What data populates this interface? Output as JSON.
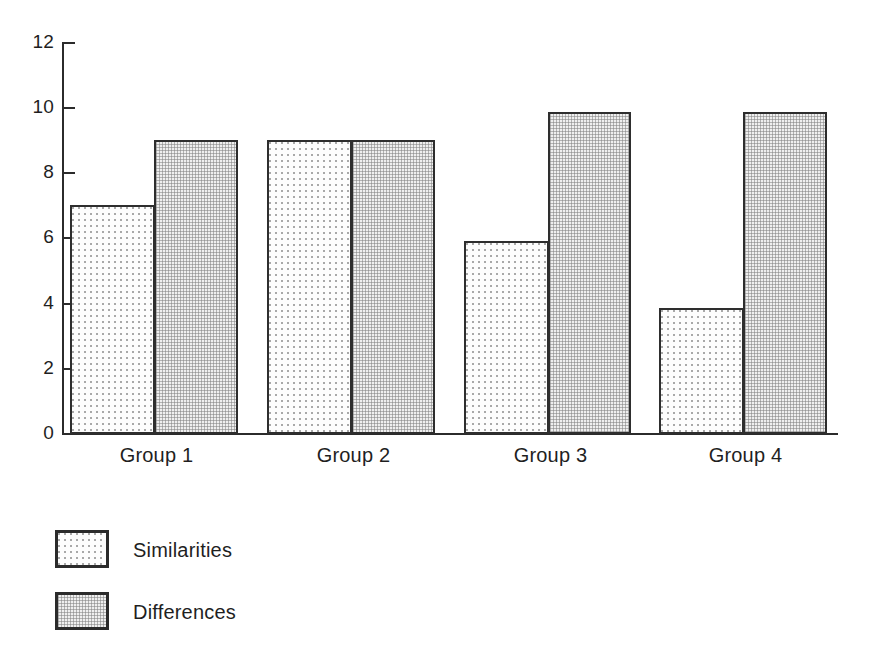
{
  "chart_data": {
    "type": "bar",
    "title": "",
    "subtitle": "",
    "xlabel": "",
    "ylabel": "",
    "categories": [
      "Group 1",
      "Group 2",
      "Group 3",
      "Group 4"
    ],
    "series": [
      {
        "name": "Similarities",
        "values": [
          7.0,
          9.0,
          5.9,
          3.85
        ]
      },
      {
        "name": "Differences",
        "values": [
          9.0,
          9.0,
          9.85,
          9.85
        ]
      }
    ],
    "ylim": [
      0,
      12
    ],
    "y_ticks": [
      0,
      2,
      4,
      6,
      8,
      10,
      12
    ],
    "y_tick_labels": [
      "0",
      "2",
      "4",
      "6",
      "8",
      "10",
      "12"
    ],
    "grid": false,
    "legend_position": "below-left",
    "bar_style": "grouped-touching",
    "colors": {
      "outline": "#2e2e2e",
      "similarities_fill": "#fdfdfd",
      "similarities_pattern": "#a9a9a9",
      "differences_fill": "#efefef",
      "differences_pattern": "#828282",
      "background": "#ffffff",
      "text": "#1f1f1f"
    }
  },
  "axis": {
    "y_labels": [
      "12",
      "10",
      "8",
      "6",
      "4",
      "2",
      "0"
    ]
  },
  "categories": {
    "group1": "Group 1",
    "group2": "Group 2",
    "group3": "Group 3",
    "group4": "Group 4"
  },
  "legend": {
    "items": [
      {
        "label": "Similarities"
      },
      {
        "label": "Differences"
      }
    ]
  }
}
